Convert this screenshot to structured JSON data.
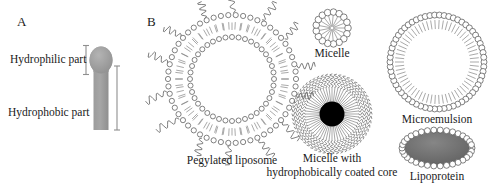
{
  "figure": {
    "background": "#ffffff",
    "width": 492,
    "height": 186,
    "ink": "#3a3a3a",
    "text_color": "#1a1a1a"
  },
  "panels": [
    {
      "id": "A",
      "label": "A"
    },
    {
      "id": "B",
      "label": "B"
    }
  ],
  "panel_a": {
    "label": "A",
    "hydrophilic_label": "Hydrophilic part",
    "hydrophobic_label": "Hydrophobic part",
    "lipid_fill": "#9a9a9a",
    "bracket_color": "#8a8a8a"
  },
  "panel_b": {
    "label": "B",
    "structures": [
      {
        "name": "pegylated-liposome",
        "caption": "Pegylated liposome",
        "caption_lines": [
          "Pegylated liposome"
        ],
        "type": "bilayer-vesicle-with-peg",
        "core_fill": "#ffffff",
        "head_count_outer": 54,
        "head_count_inner": 40,
        "peg_chain_count": 14
      },
      {
        "name": "micelle",
        "caption": "Micelle",
        "caption_lines": [
          "Micelle"
        ],
        "type": "micelle",
        "head_count": 17
      },
      {
        "name": "micelle-hydrophobic-core",
        "caption": "Micelle with hydrophobically coated core",
        "caption_lines": [
          "Micelle with",
          "hydrophobically coated core"
        ],
        "type": "micelle-with-core",
        "core_fill": "#000000",
        "spoke_count": 56
      },
      {
        "name": "microemulsion",
        "caption": "Microemulsion",
        "caption_lines": [
          "Microemulsion"
        ],
        "type": "monolayer-vesicle",
        "core_fill": "#ffffff",
        "head_count": 62
      },
      {
        "name": "lipoprotein",
        "caption": "Lipoprotein",
        "caption_lines": [
          "Lipoprotein"
        ],
        "type": "lipid-coated-ellipse",
        "core_fill": "#6e6e6e",
        "head_count": 34
      }
    ]
  }
}
